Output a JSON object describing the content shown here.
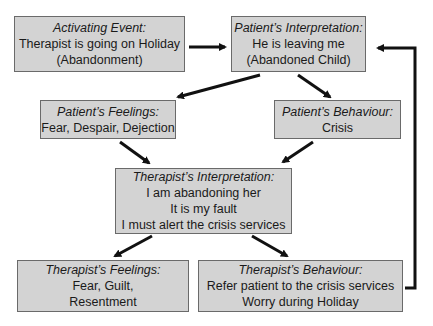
{
  "diagram": {
    "boxes": {
      "activating_event": {
        "title": "Activating Event:",
        "lines": [
          "Therapist is going on Holiday",
          "(Abandonment)"
        ]
      },
      "patient_interpretation": {
        "title": "Patient’s Interpretation:",
        "lines": [
          "He is leaving me",
          "(Abandoned Child)"
        ]
      },
      "patient_feelings": {
        "title": "Patient’s Feelings:",
        "lines": [
          "Fear, Despair, Dejection"
        ]
      },
      "patient_behaviour": {
        "title": "Patient’s Behaviour:",
        "lines": [
          "Crisis"
        ]
      },
      "therapist_interpretation": {
        "title": "Therapist’s Interpretation:",
        "lines": [
          "I am abandoning her",
          "It is my fault",
          "I must alert the crisis services"
        ]
      },
      "therapist_feelings": {
        "title": "Therapist’s Feelings:",
        "lines": [
          "Fear, Guilt,",
          "Resentment"
        ]
      },
      "therapist_behaviour": {
        "title": "Therapist’s Behaviour:",
        "lines": [
          "Refer patient to the crisis services",
          "Worry during Holiday"
        ]
      }
    },
    "edges": [
      {
        "from": "activating_event",
        "to": "patient_interpretation"
      },
      {
        "from": "patient_interpretation",
        "to": "patient_feelings"
      },
      {
        "from": "patient_interpretation",
        "to": "patient_behaviour"
      },
      {
        "from": "patient_feelings",
        "to": "therapist_interpretation"
      },
      {
        "from": "patient_behaviour",
        "to": "therapist_interpretation"
      },
      {
        "from": "therapist_interpretation",
        "to": "therapist_feelings"
      },
      {
        "from": "therapist_interpretation",
        "to": "therapist_behaviour"
      },
      {
        "from": "therapist_behaviour",
        "to": "patient_interpretation"
      }
    ]
  }
}
